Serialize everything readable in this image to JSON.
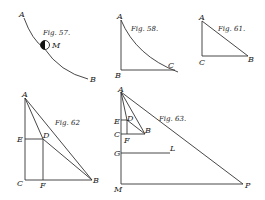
{
  "figures": {
    "fig57": {
      "caption": "Fig. 57.",
      "labels": {
        "A": "A",
        "B": "B",
        "M": "M"
      }
    },
    "fig58": {
      "caption": "Fig. 58.",
      "labels": {
        "A": "A",
        "B": "B",
        "C": "C"
      }
    },
    "fig61": {
      "caption": "Fig. 61.",
      "labels": {
        "A": "A",
        "B": "B",
        "C": "C"
      }
    },
    "fig62": {
      "caption": "Fig. 62",
      "labels": {
        "A": "A",
        "B": "B",
        "C": "C",
        "D": "D",
        "E": "E",
        "F": "F"
      }
    },
    "fig63": {
      "caption": "Fig. 63.",
      "labels": {
        "A": "A",
        "B": "B",
        "C": "C",
        "D": "D",
        "E": "E",
        "F": "F",
        "G": "G",
        "L": "L",
        "M": "M",
        "P": "P"
      }
    }
  }
}
